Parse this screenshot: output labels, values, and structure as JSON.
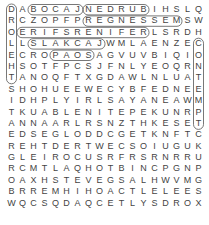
{
  "puzzle": {
    "rows": [
      "DABOCAJNEDRUBIHSLQ",
      "RCZOPFPREGNESSEMSW",
      "OERIFSRENIFERLSRDH",
      "LLSLAKCAJWMLAENZEC",
      "ECROPAOSAGVUVBIQIO",
      "HSOTFPCSJFNLYEOQRN",
      "TANOQFTXGDAWLNLUAT",
      "SHOHUEEWECYBFEDNEE",
      "IDHPLYIRLSAYANEAWM",
      "TKUABLENITEPEKUNRP",
      "ANNAARLRSNZTHKESET",
      "EDSEGLODDCGETKNFTC",
      "REHTDERTWECSOIUGUK",
      "GLEIROCUSRFRSRNRRU",
      "RCMTLAQHOTBINCPGNP",
      "OAXHSTEVEGSALHWVMG",
      "BRREMHIHOACTLELEES",
      "WQCSQDAQCETLYSDROX"
    ],
    "found_words": [
      {
        "word": "JACOB",
        "row": 0,
        "col": 2,
        "dir": "h"
      },
      {
        "word": "BURDEN",
        "row": 0,
        "col": 7,
        "dir": "h"
      },
      {
        "word": "MESSENGER",
        "row": 1,
        "col": 7,
        "dir": "h"
      },
      {
        "word": "REFINERS FIRE",
        "row": 2,
        "col": 1,
        "dir": "h"
      },
      {
        "word": "JACKALS",
        "row": 3,
        "col": 2,
        "dir": "h"
      },
      {
        "word": "SOAP",
        "row": 4,
        "col": 4,
        "dir": "h"
      },
      {
        "word": "DROLEHS",
        "row": 0,
        "col": 0,
        "dir": "v"
      },
      {
        "word": "CONTEMPT",
        "row": 3,
        "col": 17,
        "dir": "v"
      }
    ],
    "highlight_color": "#555555"
  }
}
